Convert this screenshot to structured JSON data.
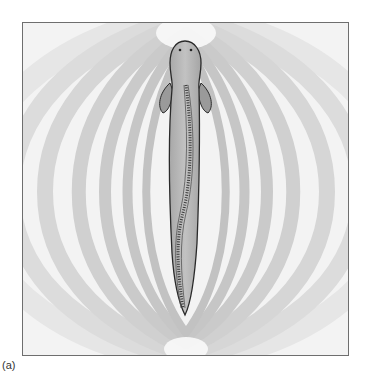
{
  "figure": {
    "panel_label": "(a)",
    "colors": {
      "background": "#ffffff",
      "frame_border": "#6e6e6e",
      "field_light": "#f6f6f6",
      "field_dark": "#d2d2d2",
      "fish_body": "#b4b4b4",
      "fish_outline": "#2a2a2a"
    }
  }
}
